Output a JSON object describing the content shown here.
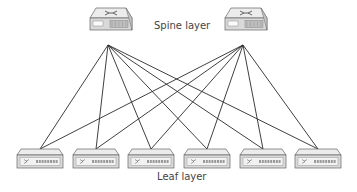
{
  "diagram": {
    "type": "spine-leaf network topology",
    "spine_label": "Spine layer",
    "leaf_label": "Leaf layer",
    "spine_switches": [
      {
        "id": "spine-1",
        "x": 90,
        "y": 8,
        "port": [
          108,
          45
        ]
      },
      {
        "id": "spine-2",
        "x": 225,
        "y": 8,
        "port": [
          243,
          45
        ]
      }
    ],
    "leaf_switches": [
      {
        "id": "leaf-1",
        "x": 17,
        "port": [
          40,
          149
        ]
      },
      {
        "id": "leaf-2",
        "x": 73,
        "port": [
          96,
          149
        ]
      },
      {
        "id": "leaf-3",
        "x": 128,
        "port": [
          151,
          149
        ]
      },
      {
        "id": "leaf-4",
        "x": 184,
        "port": [
          207,
          149
        ]
      },
      {
        "id": "leaf-5",
        "x": 240,
        "port": [
          263,
          149
        ]
      },
      {
        "id": "leaf-6",
        "x": 295,
        "port": [
          318,
          149
        ]
      }
    ],
    "colors": {
      "line": "#2a2a2a",
      "device_body": "#d9d9d9",
      "device_top": "#ececec",
      "device_outline": "#666666",
      "text": "#444444"
    }
  }
}
